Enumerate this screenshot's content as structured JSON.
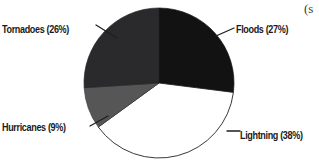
{
  "figure": {
    "corner_fragment": "(s",
    "background_color": "#ffffff"
  },
  "chart_data": {
    "type": "pie",
    "title": "",
    "subtitle": "",
    "xlabel": "",
    "ylabel": "",
    "grid": false,
    "legend_position": "callout-labels",
    "start_angle_deg": 0,
    "direction": "clockwise",
    "categories": [
      "Floods",
      "Lightning",
      "Hurricanes",
      "Tornadoes"
    ],
    "values": [
      27,
      38,
      9,
      26
    ],
    "value_unit": "percent",
    "slices": [
      {
        "name": "Floods",
        "value": 27,
        "label": "Floods (27%)",
        "color": "#121212",
        "stroke": "#111111",
        "start_deg": 0,
        "end_deg": 97.2
      },
      {
        "name": "Lightning",
        "value": 38,
        "label": "Lightning (38%)",
        "color": "#ffffff",
        "stroke": "#232323",
        "start_deg": 97.2,
        "end_deg": 234.0
      },
      {
        "name": "Hurricanes",
        "value": 9,
        "label": "Hurricanes (9%)",
        "color": "#565656",
        "stroke": "#3b3b3b",
        "start_deg": 234.0,
        "end_deg": 266.4
      },
      {
        "name": "Tornadoes",
        "value": 26,
        "label": "Tornadoes (26%)",
        "color": "#2a2a2c",
        "stroke": "#232325",
        "start_deg": 266.4,
        "end_deg": 360.0
      }
    ]
  }
}
